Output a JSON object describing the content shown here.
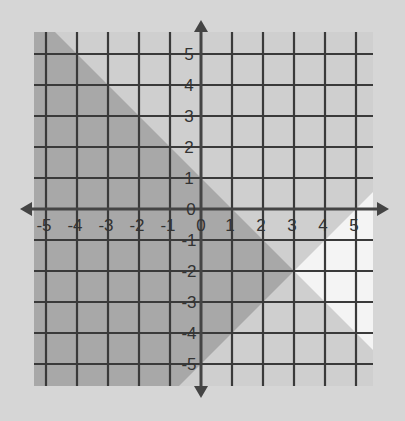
{
  "chart_data": {
    "type": "region",
    "title": "",
    "xlabel": "",
    "ylabel": "",
    "xlim": [
      -5.5,
      5.5
    ],
    "ylim": [
      -5.5,
      5.5
    ],
    "grid": true,
    "x_ticks": [
      "-5",
      "-4",
      "-3",
      "-2",
      "-1",
      "0",
      "1",
      "2",
      "3",
      "4",
      "5"
    ],
    "y_ticks": [
      "5",
      "4",
      "3",
      "2",
      "1",
      "0",
      "-1",
      "-2",
      "-3",
      "-4",
      "-5"
    ],
    "lines": [
      {
        "name": "line-1",
        "equation": "y = -x + 1",
        "slope": -1,
        "intercept": 1,
        "style": "solid"
      },
      {
        "name": "line-2",
        "equation": "y = x - 5",
        "slope": 1,
        "intercept": -5,
        "style": "solid"
      }
    ],
    "shaded_regions": [
      {
        "name": "solution-region",
        "inequalities": [
          "y < -x + 1",
          "y > x - 5"
        ],
        "shade": "dark",
        "color": "#a8a8a8"
      },
      {
        "name": "outside-both",
        "inequalities": [
          "y > -x + 1",
          "y < x - 5"
        ],
        "shade": "white",
        "color": "#f4f4f4"
      },
      {
        "name": "other",
        "shade": "light",
        "color": "#cfcfcf"
      }
    ],
    "intersection": [
      3,
      -2
    ]
  },
  "colors": {
    "background": "#d6d6d6",
    "light_region": "#cfcfcf",
    "dark_region": "#a8a8a8",
    "white_region": "#f4f4f4",
    "grid": "#3a3a3a",
    "axis": "#444444"
  }
}
